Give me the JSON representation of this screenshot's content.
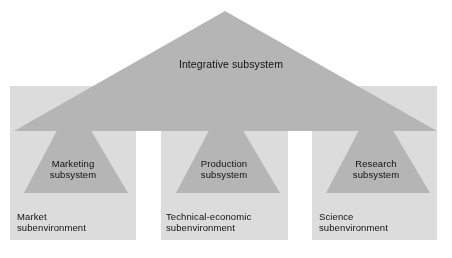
{
  "diagram": {
    "type": "conceptual-diagram",
    "canvas": {
      "width": 452,
      "height": 258,
      "background": "#ffffff"
    },
    "palette": {
      "background": "#ffffff",
      "square_fill": "#dcdcdc",
      "triangle_fill": "#b5b5b5",
      "overlap_dark": "#8a8a8a",
      "text": "#111111"
    },
    "integrative": {
      "label": "Integrative subsystem",
      "shape": "triangle",
      "apex": {
        "x": 225,
        "y": 11
      },
      "base_left": {
        "x": 14,
        "y": 131
      },
      "base_right": {
        "x": 437,
        "y": 131
      },
      "fill": "#b5b5b5"
    },
    "columns": [
      {
        "key": "marketing",
        "subsystem_label": "Marketing\nsubsystem",
        "subenvironment_label": "Market\nsubenvironment",
        "square": {
          "x": 10,
          "y": 86,
          "width": 126,
          "height": 154,
          "fill": "#dcdcdc"
        },
        "triangle": {
          "apex_x": 73,
          "apex_y": 100,
          "base_y": 193,
          "base_left_x": 24,
          "base_right_x": 128,
          "fill": "#b5b5b5"
        }
      },
      {
        "key": "production",
        "subsystem_label": "Production\nsubsystem",
        "subenvironment_label": "Technical-economic\nsubenvironment",
        "square": {
          "x": 161,
          "y": 86,
          "width": 127,
          "height": 154,
          "fill": "#dcdcdc"
        },
        "triangle": {
          "apex_x": 225,
          "apex_y": 100,
          "base_y": 193,
          "base_left_x": 176,
          "base_right_x": 280,
          "fill": "#b5b5b5"
        }
      },
      {
        "key": "research",
        "subsystem_label": "Research\nsubsystem",
        "subenvironment_label": "Science\nsubenvironment",
        "square": {
          "x": 312,
          "y": 86,
          "width": 125,
          "height": 154,
          "fill": "#dcdcdc"
        },
        "triangle": {
          "apex_x": 375,
          "apex_y": 100,
          "base_y": 193,
          "base_left_x": 326,
          "base_right_x": 430,
          "fill": "#b5b5b5"
        }
      }
    ]
  }
}
